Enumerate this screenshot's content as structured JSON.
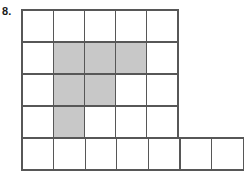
{
  "figure": {
    "problem_label": "8.",
    "colors": {
      "shaded_fill": "#c8c8c8",
      "empty_fill": "#ffffff",
      "grid_line": "#575757",
      "label_text": "#1a1a1a",
      "background": "#ffffff"
    },
    "geometry": {
      "origin_x": 22,
      "origin_y": 10,
      "cell_width": 31.2,
      "cell_height": 32,
      "bottom_cell_width": 31.6
    },
    "grid": {
      "upper_block": {
        "rows": 4,
        "columns": 5,
        "row_labels": [
          "1",
          "2",
          "3",
          "4"
        ],
        "column_labels": [
          "1",
          "2",
          "3",
          "4",
          "5"
        ],
        "shaded_map": [
          [
            false,
            false,
            false,
            false,
            false
          ],
          [
            false,
            true,
            true,
            true,
            false
          ],
          [
            false,
            true,
            true,
            false,
            false
          ],
          [
            false,
            true,
            false,
            false,
            false
          ]
        ]
      },
      "bottom_strip": {
        "rows": 1,
        "columns": 7,
        "row_labels": [
          "5"
        ],
        "column_labels": [
          "1",
          "2",
          "3",
          "4",
          "5",
          "6",
          "7"
        ],
        "shaded_map": [
          [
            false,
            false,
            false,
            false,
            false,
            false,
            false
          ]
        ]
      },
      "totals": {
        "total_squares": 27,
        "shaded_squares": 6,
        "unshaded_squares": 21
      }
    }
  }
}
